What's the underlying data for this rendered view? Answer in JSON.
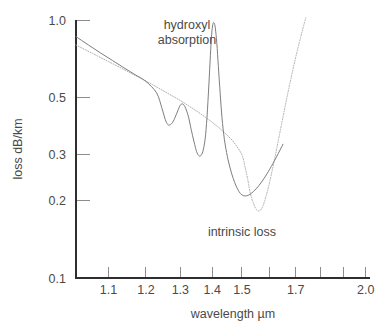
{
  "chart_data": {
    "type": "line",
    "title": "",
    "xlabel": "wavelength µm",
    "ylabel": "loss dB/km",
    "xscale": "log",
    "yscale": "log",
    "xlim": [
      1.02,
      2.02
    ],
    "ylim": [
      0.1,
      1.0
    ],
    "grid": false,
    "legend_position": "inline-annotations",
    "xticks": [
      {
        "value": 1.1,
        "label": "1.1"
      },
      {
        "value": 1.2,
        "label": "1.2"
      },
      {
        "value": 1.3,
        "label": "1.3"
      },
      {
        "value": 1.4,
        "label": "1.4"
      },
      {
        "value": 1.5,
        "label": "1.5"
      },
      {
        "value": 1.6,
        "label": ""
      },
      {
        "value": 1.7,
        "label": "1.7"
      },
      {
        "value": 1.8,
        "label": ""
      },
      {
        "value": 1.9,
        "label": ""
      },
      {
        "value": 2.0,
        "label": "2.0"
      }
    ],
    "yticks": [
      {
        "value": 1.0,
        "label": "1.0"
      },
      {
        "value": 0.5,
        "label": "0.5"
      },
      {
        "value": 0.3,
        "label": "0.3"
      },
      {
        "value": 0.2,
        "label": "0.2"
      },
      {
        "value": 0.1,
        "label": "0.1"
      }
    ],
    "annotations": [
      {
        "id": "hydroxyl",
        "text_line1": "hydroxyl",
        "text_line2": "absorption",
        "x": 1.32,
        "y": 0.92
      },
      {
        "id": "intrinsic",
        "text": "intrinsic loss",
        "x": 1.5,
        "y": 0.145
      }
    ],
    "series": [
      {
        "name": "total loss",
        "style": "solid",
        "color": "#7e7e7e",
        "points": [
          [
            1.02,
            0.862
          ],
          [
            1.05,
            0.8
          ],
          [
            1.08,
            0.745
          ],
          [
            1.11,
            0.697
          ],
          [
            1.14,
            0.653
          ],
          [
            1.17,
            0.614
          ],
          [
            1.2,
            0.578
          ],
          [
            1.23,
            0.522
          ],
          [
            1.245,
            0.457
          ],
          [
            1.255,
            0.412
          ],
          [
            1.262,
            0.394
          ],
          [
            1.268,
            0.392
          ],
          [
            1.275,
            0.398
          ],
          [
            1.283,
            0.416
          ],
          [
            1.292,
            0.444
          ],
          [
            1.3,
            0.468
          ],
          [
            1.308,
            0.472
          ],
          [
            1.316,
            0.455
          ],
          [
            1.325,
            0.42
          ],
          [
            1.333,
            0.377
          ],
          [
            1.342,
            0.337
          ],
          [
            1.35,
            0.309
          ],
          [
            1.357,
            0.298
          ],
          [
            1.363,
            0.298
          ],
          [
            1.37,
            0.31
          ],
          [
            1.377,
            0.346
          ],
          [
            1.383,
            0.42
          ],
          [
            1.389,
            0.56
          ],
          [
            1.394,
            0.73
          ],
          [
            1.398,
            0.88
          ],
          [
            1.402,
            0.962
          ],
          [
            1.406,
            0.975
          ],
          [
            1.41,
            0.93
          ],
          [
            1.415,
            0.812
          ],
          [
            1.42,
            0.66
          ],
          [
            1.426,
            0.52
          ],
          [
            1.432,
            0.418
          ],
          [
            1.44,
            0.345
          ],
          [
            1.45,
            0.296
          ],
          [
            1.46,
            0.265
          ],
          [
            1.47,
            0.243
          ],
          [
            1.48,
            0.227
          ],
          [
            1.49,
            0.216
          ],
          [
            1.5,
            0.21
          ],
          [
            1.512,
            0.208
          ],
          [
            1.525,
            0.21
          ],
          [
            1.54,
            0.216
          ],
          [
            1.56,
            0.228
          ],
          [
            1.58,
            0.244
          ],
          [
            1.6,
            0.264
          ],
          [
            1.625,
            0.294
          ],
          [
            1.65,
            0.33
          ]
        ]
      },
      {
        "name": "intrinsic loss",
        "style": "dotted",
        "color": "#adadad",
        "points": [
          [
            1.02,
            0.8
          ],
          [
            1.06,
            0.742
          ],
          [
            1.1,
            0.69
          ],
          [
            1.14,
            0.643
          ],
          [
            1.18,
            0.6
          ],
          [
            1.22,
            0.56
          ],
          [
            1.26,
            0.522
          ],
          [
            1.3,
            0.487
          ],
          [
            1.34,
            0.452
          ],
          [
            1.38,
            0.418
          ],
          [
            1.42,
            0.384
          ],
          [
            1.46,
            0.348
          ],
          [
            1.48,
            0.326
          ],
          [
            1.5,
            0.3
          ],
          [
            1.51,
            0.272
          ],
          [
            1.52,
            0.242
          ],
          [
            1.53,
            0.212
          ],
          [
            1.542,
            0.193
          ],
          [
            1.552,
            0.184
          ],
          [
            1.562,
            0.182
          ],
          [
            1.572,
            0.187
          ],
          [
            1.582,
            0.2
          ],
          [
            1.594,
            0.222
          ],
          [
            1.606,
            0.252
          ],
          [
            1.62,
            0.295
          ],
          [
            1.634,
            0.348
          ],
          [
            1.65,
            0.42
          ],
          [
            1.666,
            0.505
          ],
          [
            1.682,
            0.6
          ],
          [
            1.698,
            0.705
          ],
          [
            1.714,
            0.818
          ],
          [
            1.728,
            0.925
          ],
          [
            1.74,
            1.02
          ]
        ]
      }
    ]
  },
  "axis_titles": {
    "x": "wavelength µm",
    "y": "loss dB/km"
  },
  "labels": {
    "hydroxyl_line1": "hydroxyl",
    "hydroxyl_line2": "absorption",
    "intrinsic": "intrinsic loss"
  }
}
